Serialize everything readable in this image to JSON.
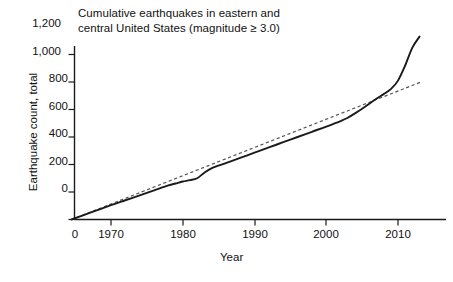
{
  "chart_data": {
    "type": "line",
    "title": "Cumulative earthquakes in eastern and central United States (magnitude ≥ 3.0)",
    "title_lines": [
      "Cumulative earthquakes in eastern and",
      "central United States (magnitude ≥ 3.0)"
    ],
    "xlabel": "Year",
    "ylabel": "Earthquake count, total",
    "xlim": [
      1964.5,
      2014.0
    ],
    "ylim": [
      0,
      1270
    ],
    "grid": false,
    "legend": "none",
    "x_origin_label": "0",
    "xticks": [
      1970,
      1980,
      1990,
      2000,
      2010
    ],
    "xticklabels": [
      "1970",
      "1980",
      "1990",
      "2000",
      "2010"
    ],
    "yticks": [
      0,
      200,
      400,
      600,
      800,
      1000,
      1200
    ],
    "yticklabels": [
      "0",
      "200",
      "400",
      "600",
      "800",
      "1,000",
      "1,200"
    ],
    "colors": {
      "cumulative_line": "#1a1a1a",
      "trend_line": "#555555",
      "axis": "#1a1a1a",
      "background": "#ffffff"
    },
    "series": [
      {
        "name": "Cumulative earthquake count",
        "style": "solid",
        "x": [
          1964.5,
          1966,
          1968,
          1970,
          1972,
          1974,
          1976,
          1978,
          1979,
          1980,
          1981,
          1982,
          1983,
          1984,
          1986,
          1988,
          1990,
          1992,
          1994,
          1996,
          1998,
          2000,
          2002,
          2003,
          2004,
          2005,
          2006,
          2007,
          2008,
          2009,
          2010,
          2011,
          2012,
          2013
        ],
        "values": [
          0,
          28,
          66,
          104,
          140,
          176,
          212,
          248,
          262,
          276,
          286,
          300,
          340,
          372,
          410,
          448,
          486,
          524,
          562,
          600,
          638,
          676,
          716,
          740,
          772,
          806,
          842,
          878,
          912,
          948,
          1010,
          1120,
          1250,
          1330
        ]
      },
      {
        "name": "Linear trend",
        "style": "dashed",
        "x": [
          1964.5,
          2013.2
        ],
        "values": [
          0,
          1000
        ]
      }
    ]
  }
}
